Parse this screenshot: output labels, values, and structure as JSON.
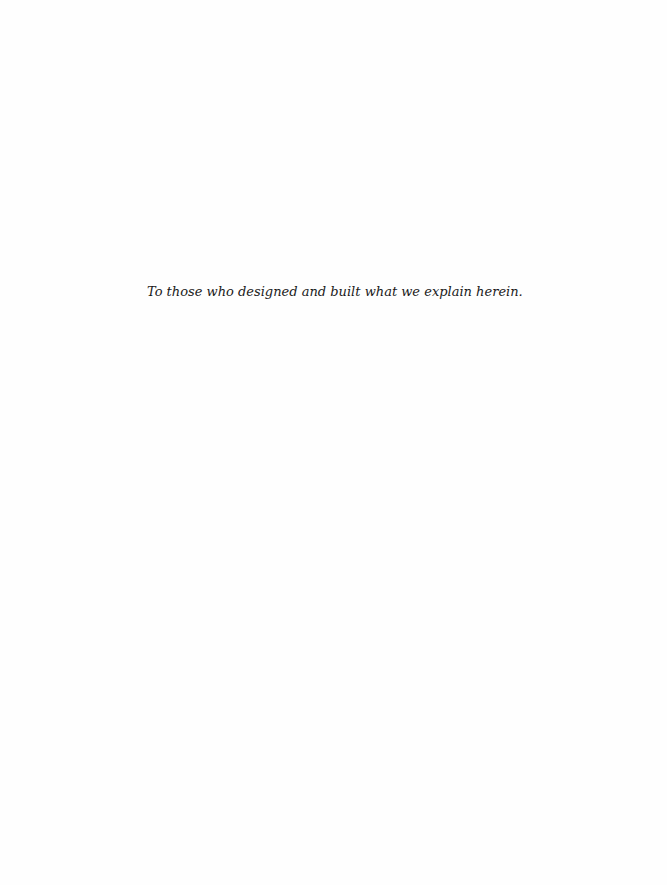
{
  "page": {
    "dedication": "To those who designed and built what we explain herein."
  }
}
